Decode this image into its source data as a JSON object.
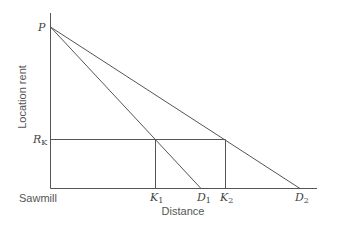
{
  "diagram": {
    "type": "location-rent-gradient",
    "axes": {
      "y_label": "Location rent",
      "x_label": "Distance",
      "origin_label": "Sawmill"
    },
    "points": {
      "p": {
        "label": "P"
      },
      "rk": {
        "label": "R",
        "sub": "K"
      },
      "k1": {
        "label": "K",
        "sub": "1"
      },
      "k2": {
        "label": "K",
        "sub": "2"
      },
      "d1": {
        "label": "D",
        "sub": "1"
      },
      "d2": {
        "label": "D",
        "sub": "2"
      }
    },
    "lines": [
      {
        "name": "rent-gradient-1",
        "from": "P",
        "to": "D1"
      },
      {
        "name": "rent-gradient-2",
        "from": "P",
        "to": "D2"
      },
      {
        "name": "rk-level",
        "from": "R_K",
        "to": "K2"
      },
      {
        "name": "k1-drop",
        "from": "K1 on R_K",
        "to": "K1"
      },
      {
        "name": "k2-drop",
        "from": "K2 on R_K",
        "to": "K2"
      }
    ],
    "colors": {
      "line": "#555555",
      "text": "#444444",
      "background": "#ffffff"
    }
  }
}
